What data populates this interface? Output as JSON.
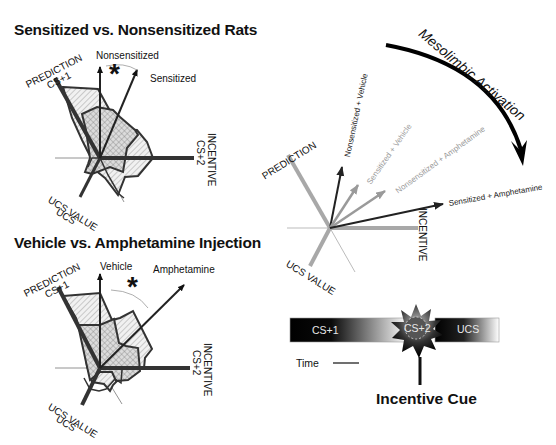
{
  "panel_top_left": {
    "title": "Sensitized vs. Nonsensitized Rats",
    "axes": {
      "prediction": "PREDICTION",
      "prediction_sub": "CS+1",
      "incentive": "INCENTIVE",
      "incentive_sub": "CS+2",
      "ucs_value": "UCS VALUE",
      "ucs_sub": "UCS"
    },
    "vector_labels": [
      "Nonsensitized",
      "Sensitized"
    ],
    "significance": "*"
  },
  "panel_bottom_left": {
    "title": "Vehicle vs. Amphetamine Injection",
    "axes": {
      "prediction": "PREDICTION",
      "prediction_sub": "CS+1",
      "incentive": "INCENTIVE",
      "incentive_sub": "CS+2",
      "ucs_value": "UCS VALUE",
      "ucs_sub": "UCS"
    },
    "vector_labels": [
      "Vehicle",
      "Amphetamine"
    ],
    "significance": "*"
  },
  "panel_right": {
    "curved_arrow_label": "Mesolimbic Activation",
    "axes": {
      "prediction": "PREDICTION",
      "incentive": "INCENTIVE",
      "ucs_value": "UCS VALUE"
    },
    "vectors": [
      {
        "label": "Nonsensitized + Vehicle",
        "color": "#222222"
      },
      {
        "label": "Sensitized + Vehicle",
        "color": "#9a9a9a"
      },
      {
        "label": "Nonsensitized + Amphetamine",
        "color": "#9a9a9a"
      },
      {
        "label": "Sensitized + Amphetamine",
        "color": "#222222"
      }
    ]
  },
  "timeline": {
    "segments": [
      "CS+1",
      "CS+2",
      "UCS"
    ],
    "time_label": "Time",
    "cue_label": "Incentive Cue"
  },
  "colors": {
    "black": "#111111",
    "gray_axis": "#a8a8a8",
    "hatch_fill": "#d8d8d8"
  }
}
